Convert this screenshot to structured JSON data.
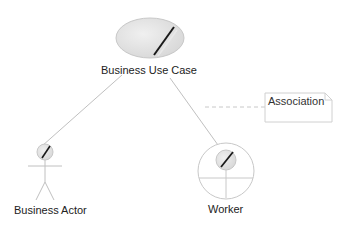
{
  "diagram": {
    "type": "UML business use case diagram",
    "nodes": [
      {
        "id": "business-use-case",
        "label": "Business Use Case",
        "shape": "business-use-case-ellipse"
      },
      {
        "id": "business-actor",
        "label": "Business Actor",
        "shape": "business-actor-stick-figure"
      },
      {
        "id": "worker",
        "label": "Worker",
        "shape": "business-worker-circle"
      }
    ],
    "edges": [
      {
        "from": "business-actor",
        "to": "business-use-case",
        "style": "solid"
      },
      {
        "from": "worker",
        "to": "business-use-case",
        "style": "solid"
      }
    ],
    "note": {
      "label": "Association",
      "attached_to": "worker-to-use-case-edge",
      "connector": "dashed"
    }
  },
  "colors": {
    "line": "#b0b0b0",
    "fill": "#e4e4e4",
    "slash": "#1a1a1a",
    "text": "#222222"
  }
}
